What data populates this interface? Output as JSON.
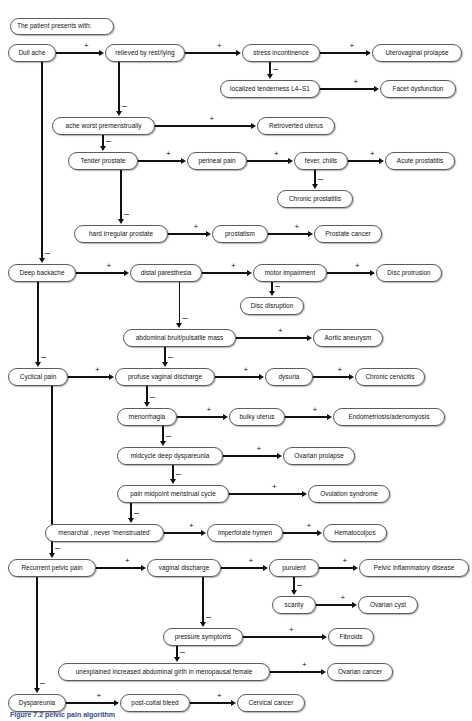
{
  "figure": {
    "title": "The patient presents with:",
    "caption": "Figure 7.2  pelvic pain algorithm",
    "edge_positive": "+",
    "edge_negative": "–"
  },
  "nodes": [
    {
      "id": "header",
      "label": "The patient presents with:",
      "x": 10,
      "y": 18,
      "w": 104,
      "h": 17
    },
    {
      "id": "dull-ache",
      "label": "Dull ache",
      "x": 8,
      "y": 44,
      "w": 48,
      "h": 18
    },
    {
      "id": "relieved-rest",
      "label": "relieved by rest/lying",
      "x": 105,
      "y": 44,
      "w": 80,
      "h": 18
    },
    {
      "id": "stress-incontinence",
      "label": "stress incontinence",
      "x": 242,
      "y": 44,
      "w": 78,
      "h": 18
    },
    {
      "id": "uterovaginal",
      "label": "Uterovaginal prolapse",
      "x": 372,
      "y": 44,
      "w": 90,
      "h": 18
    },
    {
      "id": "localized-tender",
      "label": "localized tenderness L4–S1",
      "x": 220,
      "y": 80,
      "w": 100,
      "h": 18
    },
    {
      "id": "facet",
      "label": "Facet dysfunction",
      "x": 380,
      "y": 80,
      "w": 76,
      "h": 18
    },
    {
      "id": "ache-premenstrual",
      "label": "ache worst premenstrually",
      "x": 52,
      "y": 117,
      "w": 103,
      "h": 18
    },
    {
      "id": "retroverted",
      "label": "Retroverted uterus",
      "x": 257,
      "y": 117,
      "w": 78,
      "h": 18
    },
    {
      "id": "tender-prostate",
      "label": "Tender prostate",
      "x": 68,
      "y": 152,
      "w": 70,
      "h": 18
    },
    {
      "id": "perineal-pain",
      "label": "perineal pain",
      "x": 187,
      "y": 152,
      "w": 60,
      "h": 18
    },
    {
      "id": "fever-chills",
      "label": "fever, chills",
      "x": 294,
      "y": 152,
      "w": 54,
      "h": 18
    },
    {
      "id": "acute-prostatitis",
      "label": "Acute prostatitis",
      "x": 385,
      "y": 152,
      "w": 70,
      "h": 18
    },
    {
      "id": "chronic-prostatitis",
      "label": "Chronic prostatitis",
      "x": 277,
      "y": 190,
      "w": 76,
      "h": 18
    },
    {
      "id": "hard-prostate",
      "label": "hard irregular prostate",
      "x": 74,
      "y": 225,
      "w": 94,
      "h": 18
    },
    {
      "id": "prostatism",
      "label": "prostatism",
      "x": 212,
      "y": 225,
      "w": 56,
      "h": 18
    },
    {
      "id": "prostate-cancer",
      "label": "Prostate cancer",
      "x": 314,
      "y": 225,
      "w": 68,
      "h": 18
    },
    {
      "id": "deep-backache",
      "label": "Deep backache",
      "x": 8,
      "y": 264,
      "w": 68,
      "h": 18
    },
    {
      "id": "distal-paresthesia",
      "label": "distal paresthesia",
      "x": 130,
      "y": 264,
      "w": 72,
      "h": 18
    },
    {
      "id": "motor-impairment",
      "label": "motor impairment",
      "x": 253,
      "y": 264,
      "w": 74,
      "h": 18
    },
    {
      "id": "disc-protrusion",
      "label": "Disc protrusion",
      "x": 376,
      "y": 264,
      "w": 66,
      "h": 18
    },
    {
      "id": "disc-disruption",
      "label": "Disc disruption",
      "x": 240,
      "y": 297,
      "w": 64,
      "h": 18
    },
    {
      "id": "abdominal-bruit",
      "label": "abdominal bruit/pulsatile mass",
      "x": 123,
      "y": 329,
      "w": 113,
      "h": 18
    },
    {
      "id": "aortic-aneurysm",
      "label": "Aortic aneurysm",
      "x": 313,
      "y": 329,
      "w": 70,
      "h": 18
    },
    {
      "id": "cyclical-pain",
      "label": "Cyclical pain",
      "x": 8,
      "y": 368,
      "w": 60,
      "h": 18
    },
    {
      "id": "profuse-discharge",
      "label": "profuse vaginal discharge",
      "x": 115,
      "y": 368,
      "w": 100,
      "h": 18
    },
    {
      "id": "dysuria",
      "label": "dysuria",
      "x": 265,
      "y": 368,
      "w": 48,
      "h": 18
    },
    {
      "id": "chronic-cervicitis",
      "label": "Chronic cervicitis",
      "x": 355,
      "y": 368,
      "w": 70,
      "h": 18
    },
    {
      "id": "menorrhagia",
      "label": "menorrhagia",
      "x": 117,
      "y": 408,
      "w": 60,
      "h": 18
    },
    {
      "id": "bulky-uterus",
      "label": "bulky uterus",
      "x": 229,
      "y": 408,
      "w": 56,
      "h": 18
    },
    {
      "id": "endometriosis",
      "label": "Endometriosis/adenomyosis",
      "x": 333,
      "y": 408,
      "w": 112,
      "h": 18
    },
    {
      "id": "midcycle-dysp",
      "label": "midcycle deep dyspareunia",
      "x": 117,
      "y": 447,
      "w": 106,
      "h": 18
    },
    {
      "id": "ovarian-prolapse",
      "label": "Ovarian prolapse",
      "x": 283,
      "y": 447,
      "w": 72,
      "h": 18
    },
    {
      "id": "pain-midpoint",
      "label": "pain midpoint menstrual cycle",
      "x": 117,
      "y": 485,
      "w": 112,
      "h": 18
    },
    {
      "id": "ovulation-syndrome",
      "label": "Ovulation syndrome",
      "x": 308,
      "y": 485,
      "w": 82,
      "h": 18
    },
    {
      "id": "menarchal",
      "label": "menarchal , never 'menstruated'",
      "x": 45,
      "y": 524,
      "w": 119,
      "h": 18
    },
    {
      "id": "imperforate-hymen",
      "label": "imperforate hymen",
      "x": 207,
      "y": 524,
      "w": 76,
      "h": 18
    },
    {
      "id": "hematocolpos",
      "label": "Hematocolpos",
      "x": 323,
      "y": 524,
      "w": 64,
      "h": 18
    },
    {
      "id": "recurrent-pelvic",
      "label": "Recurrent pelvic pain",
      "x": 8,
      "y": 559,
      "w": 88,
      "h": 18
    },
    {
      "id": "vaginal-discharge",
      "label": "vaginal discharge",
      "x": 147,
      "y": 559,
      "w": 74,
      "h": 18
    },
    {
      "id": "purulent",
      "label": "purulent",
      "x": 269,
      "y": 559,
      "w": 50,
      "h": 18
    },
    {
      "id": "pid",
      "label": "Pelvic inflammatory disease",
      "x": 359,
      "y": 559,
      "w": 110,
      "h": 18
    },
    {
      "id": "scanty",
      "label": "scanty",
      "x": 272,
      "y": 596,
      "w": 44,
      "h": 18
    },
    {
      "id": "ovarian-cyst",
      "label": "Ovarian cyst",
      "x": 358,
      "y": 596,
      "w": 60,
      "h": 18
    },
    {
      "id": "pressure-symptoms",
      "label": "pressure symptoms",
      "x": 163,
      "y": 628,
      "w": 80,
      "h": 18
    },
    {
      "id": "fibroids",
      "label": "Fibroids",
      "x": 328,
      "y": 628,
      "w": 46,
      "h": 18
    },
    {
      "id": "unexplained-girth",
      "label": "unexplained increased abdominal girth in menopausal female",
      "x": 58,
      "y": 663,
      "w": 212,
      "h": 18
    },
    {
      "id": "ovarian-cancer",
      "label": "Ovarian cancer",
      "x": 327,
      "y": 663,
      "w": 66,
      "h": 18
    },
    {
      "id": "dyspareunia",
      "label": "Dyspareunia",
      "x": 8,
      "y": 694,
      "w": 58,
      "h": 18
    },
    {
      "id": "post-coital",
      "label": "post-coital bleed",
      "x": 120,
      "y": 694,
      "w": 70,
      "h": 18
    },
    {
      "id": "cervical-cancer",
      "label": "Cervical cancer",
      "x": 237,
      "y": 694,
      "w": 68,
      "h": 18
    }
  ],
  "edges": [
    {
      "from": "dull-ache",
      "to": "relieved-rest",
      "sign": "+"
    },
    {
      "from": "relieved-rest",
      "to": "stress-incontinence",
      "sign": "+"
    },
    {
      "from": "stress-incontinence",
      "to": "uterovaginal",
      "sign": "+"
    },
    {
      "from": "stress-incontinence",
      "to": "localized-tender",
      "sign": "–"
    },
    {
      "from": "localized-tender",
      "to": "facet",
      "sign": "+"
    },
    {
      "from": "relieved-rest",
      "to": "ache-premenstrual",
      "sign": "–"
    },
    {
      "from": "ache-premenstrual",
      "to": "retroverted",
      "sign": "+"
    },
    {
      "from": "ache-premenstrual",
      "to": "tender-prostate",
      "sign": "–"
    },
    {
      "from": "tender-prostate",
      "to": "perineal-pain",
      "sign": "+"
    },
    {
      "from": "perineal-pain",
      "to": "fever-chills",
      "sign": "+"
    },
    {
      "from": "fever-chills",
      "to": "acute-prostatitis",
      "sign": "+"
    },
    {
      "from": "fever-chills",
      "to": "chronic-prostatitis",
      "sign": "–"
    },
    {
      "from": "tender-prostate",
      "to": "hard-prostate",
      "sign": "–"
    },
    {
      "from": "hard-prostate",
      "to": "prostatism",
      "sign": "+"
    },
    {
      "from": "prostatism",
      "to": "prostate-cancer",
      "sign": "+"
    },
    {
      "from": "dull-ache",
      "to": "deep-backache",
      "sign": "–"
    },
    {
      "from": "deep-backache",
      "to": "distal-paresthesia",
      "sign": "+"
    },
    {
      "from": "distal-paresthesia",
      "to": "motor-impairment",
      "sign": "+"
    },
    {
      "from": "motor-impairment",
      "to": "disc-protrusion",
      "sign": "+"
    },
    {
      "from": "motor-impairment",
      "to": "disc-disruption",
      "sign": "–"
    },
    {
      "from": "distal-paresthesia",
      "to": "abdominal-bruit",
      "sign": "–"
    },
    {
      "from": "abdominal-bruit",
      "to": "aortic-aneurysm",
      "sign": "+"
    },
    {
      "from": "deep-backache",
      "to": "cyclical-pain",
      "sign": "–"
    },
    {
      "from": "abdominal-bruit",
      "to": "profuse-discharge",
      "sign": "–"
    },
    {
      "from": "cyclical-pain",
      "to": "profuse-discharge",
      "sign": "+"
    },
    {
      "from": "profuse-discharge",
      "to": "dysuria",
      "sign": "+"
    },
    {
      "from": "dysuria",
      "to": "chronic-cervicitis",
      "sign": "+"
    },
    {
      "from": "profuse-discharge",
      "to": "menorrhagia",
      "sign": "–"
    },
    {
      "from": "menorrhagia",
      "to": "bulky-uterus",
      "sign": "+"
    },
    {
      "from": "bulky-uterus",
      "to": "endometriosis",
      "sign": "+"
    },
    {
      "from": "menorrhagia",
      "to": "midcycle-dysp",
      "sign": "–"
    },
    {
      "from": "midcycle-dysp",
      "to": "ovarian-prolapse",
      "sign": "+"
    },
    {
      "from": "midcycle-dysp",
      "to": "pain-midpoint",
      "sign": "–"
    },
    {
      "from": "pain-midpoint",
      "to": "ovulation-syndrome",
      "sign": "+"
    },
    {
      "from": "pain-midpoint",
      "to": "menarchal",
      "sign": "–"
    },
    {
      "from": "menarchal",
      "to": "imperforate-hymen",
      "sign": "+"
    },
    {
      "from": "imperforate-hymen",
      "to": "hematocolpos",
      "sign": "+"
    },
    {
      "from": "cyclical-pain",
      "to": "recurrent-pelvic",
      "sign": "–"
    },
    {
      "from": "recurrent-pelvic",
      "to": "vaginal-discharge",
      "sign": "+"
    },
    {
      "from": "vaginal-discharge",
      "to": "purulent",
      "sign": "+"
    },
    {
      "from": "purulent",
      "to": "pid",
      "sign": "+"
    },
    {
      "from": "purulent",
      "to": "scanty",
      "sign": "–"
    },
    {
      "from": "scanty",
      "to": "ovarian-cyst",
      "sign": "+"
    },
    {
      "from": "vaginal-discharge",
      "to": "pressure-symptoms",
      "sign": "–"
    },
    {
      "from": "pressure-symptoms",
      "to": "fibroids",
      "sign": "+"
    },
    {
      "from": "pressure-symptoms",
      "to": "unexplained-girth",
      "sign": "–"
    },
    {
      "from": "unexplained-girth",
      "to": "ovarian-cancer",
      "sign": "+"
    },
    {
      "from": "recurrent-pelvic",
      "to": "dyspareunia",
      "sign": "–"
    },
    {
      "from": "dyspareunia",
      "to": "post-coital",
      "sign": "+"
    },
    {
      "from": "post-coital",
      "to": "cervical-cancer",
      "sign": "+"
    }
  ]
}
